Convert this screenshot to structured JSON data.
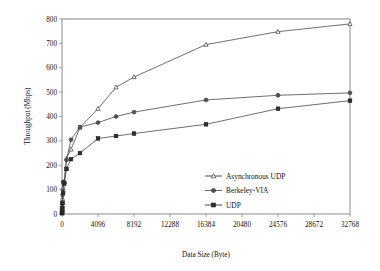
{
  "chart_data": {
    "type": "line",
    "title": "",
    "xlabel": "Data Size (Byte)",
    "ylabel": "Throughput (Mbps)",
    "xlim": [
      0,
      32768
    ],
    "ylim": [
      0,
      800
    ],
    "xticks": [
      0,
      4096,
      8192,
      12288,
      16384,
      20480,
      24576,
      28672,
      32768
    ],
    "xtick_labels": [
      "0",
      "4096",
      "8192",
      "12288",
      "16384",
      "20480",
      "24576",
      "28672",
      "32768"
    ],
    "yticks": [
      0,
      100,
      200,
      300,
      400,
      500,
      600,
      700,
      800
    ],
    "ytick_labels": [
      "0",
      "100",
      "200",
      "300",
      "400",
      "500",
      "600",
      "700",
      "800"
    ],
    "grid": "horizontal",
    "legend_position": "center-right-inside",
    "x": [
      4,
      8,
      16,
      32,
      64,
      128,
      256,
      512,
      1024,
      2048,
      4096,
      6144,
      8192,
      16384,
      24576,
      32768
    ],
    "series": [
      {
        "name": "Asynchronous UDP",
        "marker": "triangle-open",
        "color": "#3a3a3a",
        "values": [
          5,
          9,
          18,
          34,
          62,
          108,
          132,
          228,
          265,
          355,
          432,
          520,
          562,
          695,
          748,
          780
        ]
      },
      {
        "name": "Berkeley-VIA",
        "marker": "circle-filled",
        "color": "#585858",
        "values": [
          6,
          12,
          22,
          42,
          78,
          132,
          130,
          222,
          305,
          357,
          375,
          400,
          418,
          468,
          487,
          497
        ]
      },
      {
        "name": "UDP",
        "marker": "square-filled",
        "color": "#2e2e2e",
        "values": [
          3,
          6,
          12,
          24,
          45,
          88,
          125,
          185,
          225,
          250,
          310,
          320,
          330,
          368,
          432,
          465
        ]
      }
    ]
  },
  "legend": {
    "items": [
      {
        "label": "Asynchronous UDP"
      },
      {
        "label": "Berkeley-VIA"
      },
      {
        "label": "UDP"
      }
    ]
  }
}
